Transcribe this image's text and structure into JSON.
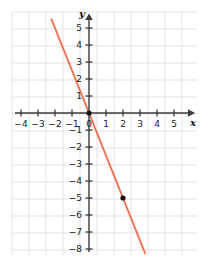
{
  "chart_data": {
    "type": "line",
    "title": "",
    "xlabel": "x",
    "ylabel": "y",
    "grid": true,
    "legend": false,
    "xlim": [
      -5,
      6
    ],
    "ylim": [
      -9,
      6
    ],
    "xticks": [
      -4,
      -3,
      -2,
      -1,
      0,
      1,
      2,
      3,
      4,
      5
    ],
    "yticks": [
      5,
      4,
      3,
      2,
      1,
      -1,
      -2,
      -3,
      -4,
      -5,
      -6,
      -7,
      -8
    ],
    "xtick_labels": [
      "−4",
      "−3",
      "−2",
      "−1",
      "0",
      "1",
      "2",
      "3",
      "4",
      "5"
    ],
    "ytick_labels": [
      "5",
      "4",
      "3",
      "2",
      "1",
      "−1",
      "−2",
      "−3",
      "−4",
      "−5",
      "−6",
      "−7",
      "−8"
    ],
    "origin_label": "0",
    "series": [
      {
        "name": "line",
        "equation": "y = -2.5x",
        "slope": -2.5,
        "intercept": 0,
        "color": "#e8663c",
        "x": [
          -2.2,
          3.3
        ],
        "values": [
          5.5,
          -8.25
        ]
      }
    ],
    "points": [
      {
        "x": 0,
        "y": 0,
        "label": "",
        "color": "#111111"
      },
      {
        "x": 2,
        "y": -5,
        "label": "",
        "color": "#111111"
      }
    ],
    "axis_color": "#3a3a3a",
    "grid_color": "#e3e3e8",
    "background": "#ffffff"
  },
  "labels": {
    "x_axis_name": "x",
    "y_axis_name": "y"
  }
}
